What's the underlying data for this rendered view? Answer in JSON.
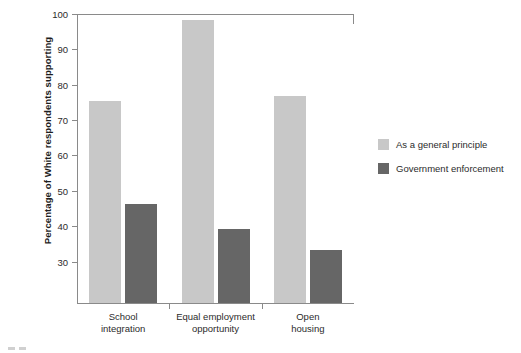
{
  "chart_data": {
    "type": "bar",
    "title": "",
    "xlabel": "",
    "ylabel": "Percentage of White respondents supporting",
    "categories": [
      "School integration",
      "Equal employment opportunity",
      "Open housing"
    ],
    "series": [
      {
        "name": "As a general principle",
        "color": "#c8c8c8",
        "values": [
          75,
          98,
          76.5
        ]
      },
      {
        "name": "Government enforcement",
        "color": "#666666",
        "values": [
          46,
          39,
          33
        ]
      }
    ],
    "ylim": [
      18,
      100
    ],
    "yticks": [
      30,
      40,
      50,
      60,
      70,
      80,
      90,
      100
    ],
    "ytick_labels": [
      "30",
      "40",
      "50",
      "60",
      "70",
      "80",
      "90",
      "100"
    ],
    "grid": false,
    "legend_position": "right"
  },
  "legend": {
    "items": [
      {
        "label": "As a general principle"
      },
      {
        "label": "Government enforcement"
      }
    ]
  },
  "axis": {
    "y_title": "Percentage of White respondents supporting"
  },
  "categories_display": [
    {
      "line1": "School",
      "line2": "integration"
    },
    {
      "line1": "Equal employment",
      "line2": "opportunity"
    },
    {
      "line1": "Open",
      "line2": "housing"
    }
  ]
}
